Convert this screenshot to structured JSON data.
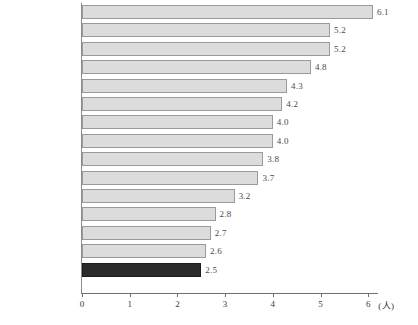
{
  "chart_data": {
    "type": "bar",
    "orientation": "horizontal",
    "title": "",
    "subtitle": "",
    "xlabel": "(人)",
    "ylabel": "",
    "xlim": [
      0,
      6.3
    ],
    "xticks": [
      0,
      1,
      2,
      3,
      4,
      5,
      6
    ],
    "xtick_labels": [
      "0",
      "1",
      "2",
      "3",
      "4",
      "5",
      "6"
    ],
    "grid": false,
    "legend": null,
    "unit_label": "(人)",
    "categories": [
      "ギリシャ",
      "オーストリア",
      "ポルトガル",
      "ノルウェー",
      "ドイツ",
      "デンマーク",
      "スペイン",
      "イタリア",
      "オーストラリア",
      "オランダ",
      "フランス",
      "イギリス",
      "カナダ",
      "アメリカ",
      "日本"
    ],
    "values": [
      6.1,
      5.2,
      5.2,
      4.8,
      4.3,
      4.2,
      4.0,
      4.0,
      3.8,
      3.7,
      3.2,
      2.8,
      2.7,
      2.6,
      2.5
    ],
    "value_labels": [
      "6.1",
      "5.2",
      "5.2",
      "4.8",
      "4.3",
      "4.2",
      "4.0",
      "4.0",
      "3.8",
      "3.7",
      "3.2",
      "2.8",
      "2.7",
      "2.6",
      "2.5"
    ],
    "highlight_index": 14,
    "colors": {
      "bar_fill": "#dcdcdc",
      "bar_border": "#9a9a9a",
      "highlight_fill": "#2b2b2b",
      "highlight_border": "#1c1c1c",
      "axis": "#6e6e6e",
      "text": "#3a3a3a",
      "background": "#ffffff"
    }
  }
}
